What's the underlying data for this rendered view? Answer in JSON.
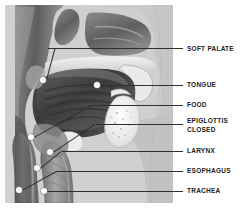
{
  "figure": {
    "style": "grayscale medical illustration",
    "background_color": "#cfcfcf",
    "label_color": "#222222",
    "marker_color": "#ffffff",
    "leader_color": "#2f2f2f"
  },
  "labels": [
    {
      "id": "soft-palate",
      "text": "SOFT PALATE",
      "y": 46,
      "marker_x": 43,
      "marker_y": 80
    },
    {
      "id": "tongue",
      "text": "TONGUE",
      "y": 82,
      "marker_x": 97,
      "marker_y": 85
    },
    {
      "id": "food",
      "text": "FOOD",
      "y": 103,
      "marker_x": 31,
      "marker_y": 137
    },
    {
      "id": "epiglottis",
      "text": "EPIGLOTTIS\nCLOSED",
      "y": 120,
      "marker_x": 50,
      "marker_y": 152
    },
    {
      "id": "larynx",
      "text": "LARYNX",
      "y": 149,
      "marker_x": 37,
      "marker_y": 168
    },
    {
      "id": "esophagus",
      "text": "ESOPHAGUS",
      "y": 169,
      "marker_x": 19,
      "marker_y": 190
    },
    {
      "id": "trachea",
      "text": "TRACHEA",
      "y": 189,
      "marker_x": 44,
      "marker_y": 191
    }
  ]
}
